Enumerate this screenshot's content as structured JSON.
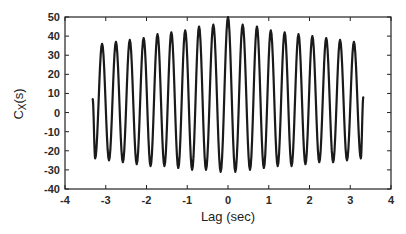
{
  "chart_data": {
    "type": "line",
    "title": "",
    "xlabel": "Lag (sec)",
    "ylabel_main": "C",
    "ylabel_sub": "X",
    "ylabel_suffix": "(s)",
    "xlim": [
      -4,
      4
    ],
    "ylim": [
      -40,
      50
    ],
    "xticks": [
      -4,
      -3,
      -2,
      -1,
      0,
      1,
      2,
      3,
      4
    ],
    "yticks": [
      -40,
      -30,
      -20,
      -10,
      0,
      10,
      20,
      30,
      40,
      50
    ],
    "grid": false,
    "legend": null,
    "series": [
      {
        "name": "Cx(s)",
        "color": "#1a1a1a",
        "start": {
          "x": -3.32,
          "y": 7
        },
        "end": {
          "x": 3.32,
          "y": 8
        },
        "troughs": [
          {
            "x": -3.26,
            "y": -24
          },
          {
            "x": -2.92,
            "y": -25
          },
          {
            "x": -2.58,
            "y": -26
          },
          {
            "x": -2.24,
            "y": -27
          },
          {
            "x": -1.9,
            "y": -28
          },
          {
            "x": -1.56,
            "y": -28
          },
          {
            "x": -1.22,
            "y": -29
          },
          {
            "x": -0.88,
            "y": -30
          },
          {
            "x": -0.54,
            "y": -30
          },
          {
            "x": -0.18,
            "y": -31
          },
          {
            "x": 0.18,
            "y": -31
          },
          {
            "x": 0.54,
            "y": -30
          },
          {
            "x": 0.88,
            "y": -29
          },
          {
            "x": 1.22,
            "y": -28
          },
          {
            "x": 1.56,
            "y": -28
          },
          {
            "x": 1.9,
            "y": -27
          },
          {
            "x": 2.24,
            "y": -26
          },
          {
            "x": 2.58,
            "y": -26
          },
          {
            "x": 2.92,
            "y": -25
          },
          {
            "x": 3.26,
            "y": -24
          }
        ],
        "peaks": [
          {
            "x": -3.09,
            "y": 36
          },
          {
            "x": -2.75,
            "y": 37
          },
          {
            "x": -2.41,
            "y": 38
          },
          {
            "x": -2.07,
            "y": 39
          },
          {
            "x": -1.73,
            "y": 41
          },
          {
            "x": -1.39,
            "y": 42
          },
          {
            "x": -1.05,
            "y": 43
          },
          {
            "x": -0.71,
            "y": 45
          },
          {
            "x": -0.36,
            "y": 46
          },
          {
            "x": 0.0,
            "y": 50
          },
          {
            "x": 0.36,
            "y": 46
          },
          {
            "x": 0.71,
            "y": 45
          },
          {
            "x": 1.05,
            "y": 43
          },
          {
            "x": 1.39,
            "y": 42
          },
          {
            "x": 1.73,
            "y": 41
          },
          {
            "x": 2.07,
            "y": 40
          },
          {
            "x": 2.41,
            "y": 39
          },
          {
            "x": 2.75,
            "y": 38
          },
          {
            "x": 3.09,
            "y": 37
          }
        ]
      }
    ]
  }
}
